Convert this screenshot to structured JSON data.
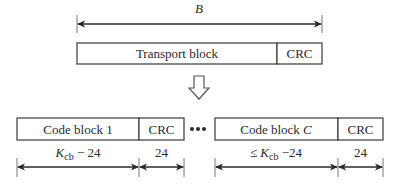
{
  "top": {
    "length_label": "B",
    "transport_block_label": "Transport block",
    "crc_label": "CRC"
  },
  "arrow": {
    "icon": "hollow-down-arrow-icon"
  },
  "bottom": {
    "code_block_first": {
      "label_prefix": "Code block ",
      "label_index": "1",
      "crc_label": "CRC"
    },
    "ellipsis": "•••",
    "code_block_last": {
      "label_prefix": "Code block ",
      "label_index": "C",
      "crc_label": "CRC"
    },
    "dims": {
      "first_data": {
        "prefix": "",
        "var": "K",
        "sub": "cb",
        "suffix": " − 24"
      },
      "first_crc": "24",
      "last_data": {
        "prefix": "≤ ",
        "var": "K",
        "sub": "cb",
        "suffix": " −24"
      },
      "last_crc": "24"
    }
  }
}
